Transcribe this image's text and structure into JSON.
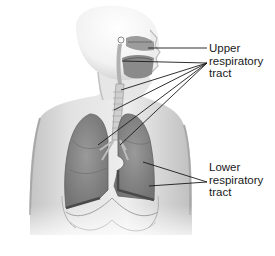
{
  "diagram": {
    "labels": {
      "upper": {
        "lines": [
          "Upper",
          "respiratory",
          "tract"
        ],
        "anchor": [
          207,
          63
        ]
      },
      "lower": {
        "lines": [
          "Lower",
          "respiratory",
          "tract"
        ],
        "anchor": [
          207,
          182
        ]
      }
    },
    "leader_lines": {
      "upper": [
        {
          "from": [
            207,
            48
          ],
          "to": [
            148,
            48
          ],
          "target": "nasal cavity"
        },
        {
          "from": [
            207,
            63
          ],
          "to": [
            122,
            61
          ],
          "target": "oral cavity / pharynx"
        },
        {
          "from": [
            207,
            63
          ],
          "to": [
            121,
            90
          ],
          "target": "larynx"
        },
        {
          "from": [
            207,
            63
          ],
          "to": [
            114,
            110
          ],
          "target": "trachea"
        },
        {
          "from": [
            207,
            63
          ],
          "to": [
            98,
            145
          ],
          "target": "right bronchus"
        },
        {
          "from": [
            207,
            63
          ],
          "to": [
            120,
            145
          ],
          "target": "left bronchus"
        }
      ],
      "lower": [
        {
          "from": [
            207,
            182
          ],
          "to": [
            143,
            162
          ],
          "target": "left lung upper"
        },
        {
          "from": [
            207,
            182
          ],
          "to": [
            149,
            186
          ],
          "target": "left lung lower"
        }
      ]
    },
    "colors": {
      "skin": "#e6e6e6",
      "skin_shadow": "#bdbdbd",
      "lung": "#8a8a8a",
      "lung_dark": "#5e5e5e",
      "airway": "#cfcfcf",
      "line": "#1a1a1a",
      "text": "#1a1a1a"
    }
  }
}
